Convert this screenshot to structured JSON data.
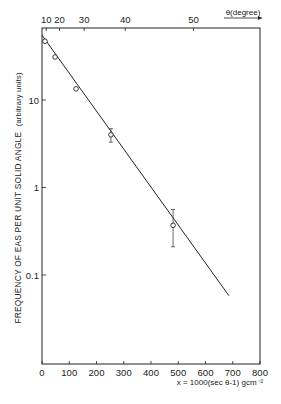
{
  "chart_data": {
    "type": "scatter",
    "title": "",
    "xlabel": "x = 1000(sec θ-1) gcm⁻²",
    "ylabel": "FREQUENCY OF EAS PER UNIT SOLID ANGLE",
    "ylabel_units": "(arbitrary units)",
    "top_axis_label": "θ(degree)",
    "xlim": [
      0,
      800
    ],
    "ylim": [
      0.01,
      66
    ],
    "yscale": "log",
    "grid": false,
    "legend": null,
    "x_ticks": [
      0,
      100,
      200,
      300,
      400,
      500,
      600,
      700,
      800
    ],
    "x_tick_labels": [
      "0",
      "100",
      "200",
      "300",
      "400",
      "500",
      "600",
      "700",
      "800"
    ],
    "y_ticks": [
      10,
      1,
      0.1
    ],
    "y_tick_labels": [
      "10",
      "1",
      "0.1"
    ],
    "top_ticks_degrees": [
      10,
      20,
      30,
      40,
      50
    ],
    "top_tick_labels": [
      "10",
      "20",
      "30",
      "40",
      "50"
    ],
    "series": [
      {
        "name": "measured",
        "marker": "open-circle",
        "points": [
          {
            "x": 11,
            "y": 47,
            "err_low": null,
            "err_high": null
          },
          {
            "x": 48,
            "y": 31,
            "err_low": null,
            "err_high": null
          },
          {
            "x": 125,
            "y": 13.4,
            "err_low": null,
            "err_high": null
          },
          {
            "x": 253,
            "y": 4.0,
            "err_low": 3.3,
            "err_high": 4.7
          },
          {
            "x": 481,
            "y": 0.37,
            "err_low": 0.21,
            "err_high": 0.56
          }
        ]
      },
      {
        "name": "fit",
        "type": "line",
        "points": [
          {
            "x": 0,
            "y": 55
          },
          {
            "x": 686,
            "y": 0.058
          }
        ]
      }
    ]
  }
}
